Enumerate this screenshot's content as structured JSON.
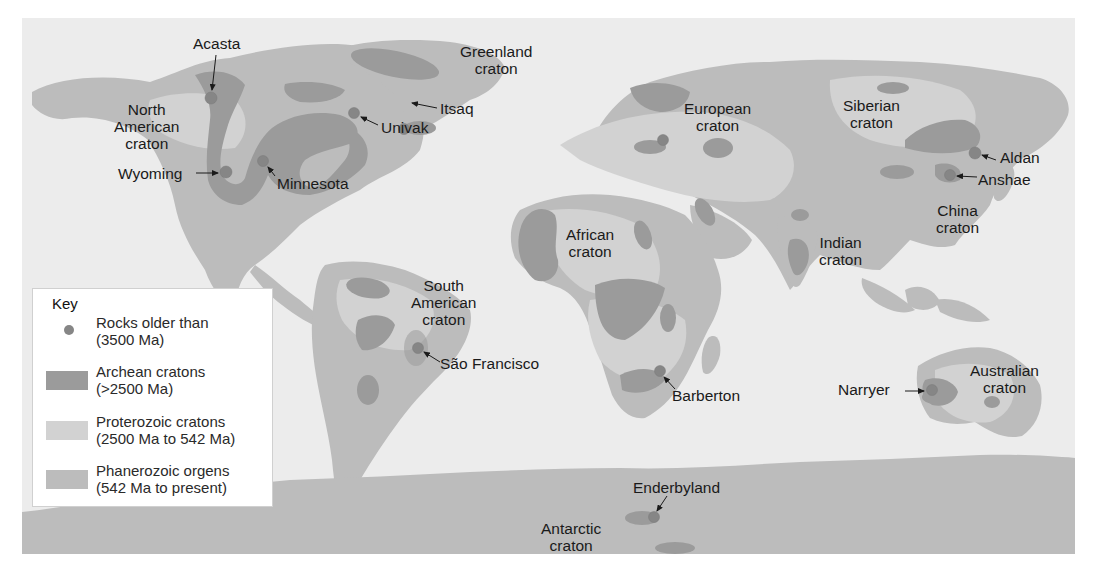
{
  "colors": {
    "ocean": "#ececec",
    "archean": "#9b9b9b",
    "proterozoic": "#d2d2d2",
    "phanerozoic": "#bcbcbc",
    "old_rock_dot": "#868686",
    "label_text": "#1a1a1a"
  },
  "map": {
    "craton_labels": [
      {
        "id": "north-american",
        "line1": "North",
        "line2": "American",
        "line3": "craton"
      },
      {
        "id": "greenland",
        "line1": "Greenland",
        "line2": "craton"
      },
      {
        "id": "european",
        "line1": "European",
        "line2": "craton"
      },
      {
        "id": "siberian",
        "line1": "Siberian",
        "line2": "craton"
      },
      {
        "id": "china",
        "line1": "China",
        "line2": "craton"
      },
      {
        "id": "indian",
        "line1": "Indian",
        "line2": "craton"
      },
      {
        "id": "african",
        "line1": "African",
        "line2": "craton"
      },
      {
        "id": "south-american",
        "line1": "South",
        "line2": "American",
        "line3": "craton"
      },
      {
        "id": "australian",
        "line1": "Australian",
        "line2": "craton"
      },
      {
        "id": "antarctic",
        "line1": "Antarctic",
        "line2": "craton"
      }
    ],
    "old_rock_sites": [
      {
        "id": "acasta",
        "name": "Acasta"
      },
      {
        "id": "wyoming",
        "name": "Wyoming"
      },
      {
        "id": "minnesota",
        "name": "Minnesota"
      },
      {
        "id": "univak",
        "name": "Univak"
      },
      {
        "id": "itsaq",
        "name": "Itsaq"
      },
      {
        "id": "aldan",
        "name": "Aldan"
      },
      {
        "id": "anshae",
        "name": "Anshae"
      },
      {
        "id": "sao-francisco",
        "name": "São Francisco"
      },
      {
        "id": "barberton",
        "name": "Barberton"
      },
      {
        "id": "narryer",
        "name": "Narryer"
      },
      {
        "id": "enderbyland",
        "name": "Enderbyland"
      }
    ]
  },
  "key": {
    "title": "Key",
    "items": [
      {
        "type": "dot",
        "line1": "Rocks older than",
        "line2": "(3500 Ma)"
      },
      {
        "type": "archean",
        "line1": "Archean cratons",
        "line2": "(>2500 Ma)"
      },
      {
        "type": "proterozoic",
        "line1": "Proterozoic cratons",
        "line2": "(2500 Ma to 542 Ma)"
      },
      {
        "type": "phanerozoic",
        "line1": "Phanerozoic orgens",
        "line2": "(542 Ma to present)"
      }
    ]
  }
}
